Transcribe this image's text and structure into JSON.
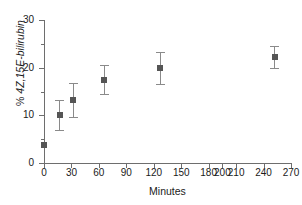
{
  "chart_data": {
    "type": "scatter",
    "title": "",
    "xlabel": "Minutes",
    "ylabel": "% 4Z,15E-bilirubin",
    "ylabel_prefix": "% ",
    "ylabel_italic": "4Z,15E-bilirubin",
    "xlim": [
      0,
      270
    ],
    "ylim": [
      0,
      30
    ],
    "grid": false,
    "legend": null,
    "xticks": [
      0,
      30,
      60,
      90,
      120,
      150,
      180,
      200,
      210,
      240,
      270
    ],
    "xtick_labels": [
      "0",
      "30",
      "60",
      "90",
      "120",
      "150",
      "180",
      "200",
      "210",
      "240",
      "270"
    ],
    "xtick_values": [
      0,
      30,
      60,
      90,
      120,
      150,
      180,
      195,
      210,
      240,
      270
    ],
    "yticks": [
      0,
      10,
      20,
      30
    ],
    "ytick_labels": [
      "0",
      "10",
      "20",
      "30"
    ],
    "yticks_minor": [
      5,
      15,
      25
    ],
    "marker_color": "#555555",
    "errorbar_color": "#8a8a8a",
    "axis_color": "#6e6e6e",
    "x": [
      0,
      17,
      32,
      66,
      127,
      252
    ],
    "y": [
      3.8,
      10.1,
      13.2,
      17.5,
      19.9,
      22.2
    ],
    "yerr": [
      0.0,
      3.2,
      3.5,
      3.1,
      3.3,
      2.3
    ],
    "points": [
      {
        "x": 0,
        "y": 3.8,
        "yerr": 0.0
      },
      {
        "x": 17,
        "y": 10.1,
        "yerr": 3.2
      },
      {
        "x": 32,
        "y": 13.2,
        "yerr": 3.5
      },
      {
        "x": 66,
        "y": 17.5,
        "yerr": 3.1
      },
      {
        "x": 127,
        "y": 19.9,
        "yerr": 3.3
      },
      {
        "x": 252,
        "y": 22.2,
        "yerr": 2.3
      }
    ]
  }
}
